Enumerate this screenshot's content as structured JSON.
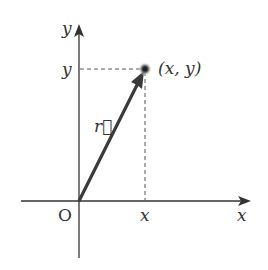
{
  "diagram": {
    "type": "position-vector",
    "axes": {
      "x_label": "x",
      "y_label": "y",
      "origin_label": "O"
    },
    "point": {
      "label": "(x, y)",
      "x_tick_label": "x",
      "y_tick_label": "y"
    },
    "vector": {
      "label": "r⃗",
      "from": "O",
      "to": "(x, y)"
    },
    "colors": {
      "axis": "#333333",
      "vector": "#3a3a3a",
      "guide": "#555555",
      "point": "#222222"
    }
  }
}
